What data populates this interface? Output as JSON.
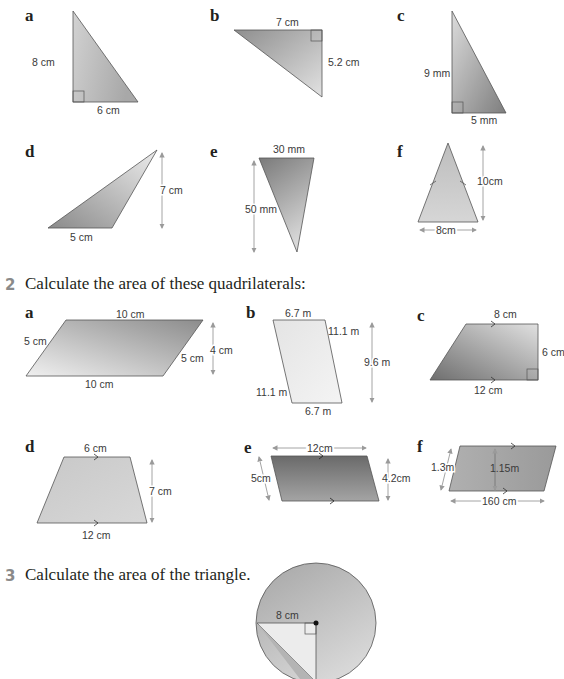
{
  "colors": {
    "shape_light": "#e6e6e6",
    "shape_dark": "#8c8c8c",
    "outline": "#555555",
    "dimension_arrow": "#9a9a9a",
    "question_number": "#8a8a8a"
  },
  "section1": {
    "items": [
      {
        "letter": "a",
        "labels": {
          "height": "8 cm",
          "base": "6 cm"
        }
      },
      {
        "letter": "b",
        "labels": {
          "top": "7 cm",
          "side": "5.2 cm"
        }
      },
      {
        "letter": "c",
        "labels": {
          "height": "9 mm",
          "base": "5 mm"
        }
      },
      {
        "letter": "d",
        "labels": {
          "base": "5 cm",
          "height": "7 cm"
        }
      },
      {
        "letter": "e",
        "labels": {
          "top": "30 mm",
          "height": "50 mm"
        }
      },
      {
        "letter": "f",
        "labels": {
          "height": "10cm",
          "base": "8cm"
        }
      }
    ]
  },
  "question2": {
    "number": "2",
    "text": "Calculate the area of these quadrilaterals:",
    "items": [
      {
        "letter": "a",
        "labels": {
          "top": "10 cm",
          "left": "5 cm",
          "right": "5 cm",
          "height": "4 cm",
          "bottom": "10 cm"
        }
      },
      {
        "letter": "b",
        "labels": {
          "top": "6.7 m",
          "right": "11.1 m",
          "left": "11.1 m",
          "bottom": "6.7 m",
          "height": "9.6 m"
        }
      },
      {
        "letter": "c",
        "labels": {
          "top": "8 cm",
          "right": "6 cm",
          "bottom": "12 cm"
        }
      },
      {
        "letter": "d",
        "labels": {
          "top": "6 cm",
          "height": "7 cm",
          "bottom": "12 cm"
        }
      },
      {
        "letter": "e",
        "labels": {
          "top": "12cm",
          "left": "5cm",
          "height": "4.2cm"
        }
      },
      {
        "letter": "f",
        "labels": {
          "left": "1.3m",
          "height": "1.15m",
          "bottom": "160 cm"
        }
      }
    ]
  },
  "question3": {
    "number": "3",
    "text": "Calculate the area of the triangle.",
    "labels": {
      "radius": "8 cm"
    }
  }
}
